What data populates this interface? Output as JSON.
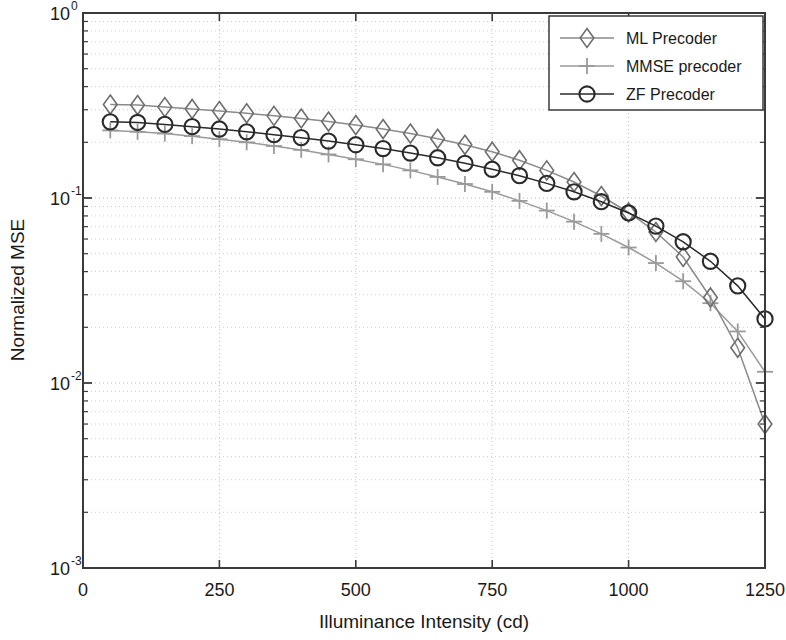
{
  "chart_data": {
    "type": "line",
    "title": "",
    "xlabel": "Illuminance Intensity (cd)",
    "ylabel": "Normalized MSE",
    "xlim": [
      0,
      1250
    ],
    "ylim": [
      0.001,
      1
    ],
    "yscale": "log",
    "xscale": "linear",
    "grid": true,
    "grid_style": "dotted",
    "legend_position": "top-right",
    "xticks": [
      0,
      250,
      500,
      750,
      1000,
      1250
    ],
    "xtick_labels": [
      "0",
      "250",
      "500",
      "750",
      "1000",
      "1250"
    ],
    "yticks": [
      1,
      0.1,
      0.01,
      0.001
    ],
    "ytick_labels": [
      "10^0",
      "10^-1",
      "10^-2",
      "10^-3"
    ],
    "ytick_mantissas": [
      "10",
      "10",
      "10",
      "10"
    ],
    "ytick_exponents": [
      "0",
      "-1",
      "-2",
      "-3"
    ],
    "x": [
      50,
      100,
      150,
      200,
      250,
      300,
      350,
      400,
      450,
      500,
      550,
      600,
      650,
      700,
      750,
      800,
      850,
      900,
      950,
      1000,
      1050,
      1100,
      1150,
      1200,
      1250
    ],
    "series": [
      {
        "name": "ML Precoder",
        "marker": "diamond",
        "color": "#6e6e6e",
        "line_color": "#8a8a8a",
        "values": [
          0.32,
          0.318,
          0.31,
          0.303,
          0.295,
          0.287,
          0.278,
          0.269,
          0.259,
          0.248,
          0.236,
          0.223,
          0.209,
          0.194,
          0.178,
          0.16,
          0.141,
          0.122,
          0.1025,
          0.0835,
          0.0655,
          0.048,
          0.029,
          0.0155,
          0.006
        ]
      },
      {
        "name": "MMSE precoder",
        "marker": "plus",
        "color": "#9a9a9a",
        "line_color": "#9a9a9a",
        "values": [
          0.232,
          0.228,
          0.223,
          0.216,
          0.208,
          0.2,
          0.191,
          0.182,
          0.172,
          0.162,
          0.152,
          0.141,
          0.13,
          0.119,
          0.108,
          0.0965,
          0.0855,
          0.0745,
          0.064,
          0.054,
          0.0445,
          0.0355,
          0.027,
          0.019,
          0.0115
        ]
      },
      {
        "name": "ZF Precoder",
        "marker": "circle",
        "color": "#2a2a2a",
        "line_color": "#2a2a2a",
        "values": [
          0.258,
          0.256,
          0.25,
          0.243,
          0.236,
          0.228,
          0.22,
          0.212,
          0.203,
          0.194,
          0.185,
          0.175,
          0.165,
          0.154,
          0.143,
          0.132,
          0.12,
          0.108,
          0.0955,
          0.083,
          0.0705,
          0.058,
          0.0455,
          0.0335,
          0.0222
        ]
      }
    ]
  },
  "legend": {
    "items": [
      {
        "label": "ML Precoder"
      },
      {
        "label": "MMSE precoder"
      },
      {
        "label": "ZF Precoder"
      }
    ]
  }
}
